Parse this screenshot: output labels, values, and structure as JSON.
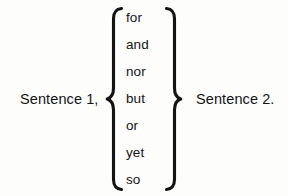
{
  "diagram": {
    "type": "coordinating-conjunction-sentence-pattern",
    "background_color": "#fdfdfc",
    "text_color": "#141414",
    "left_clause": "Sentence 1,",
    "right_clause": "Sentence 2.",
    "brace_left_glyph": "{",
    "brace_right_glyph": "}",
    "conjunctions": [
      {
        "label": "for"
      },
      {
        "label": "and"
      },
      {
        "label": "nor"
      },
      {
        "label": "but"
      },
      {
        "label": "or"
      },
      {
        "label": "yet"
      },
      {
        "label": "so"
      }
    ]
  }
}
